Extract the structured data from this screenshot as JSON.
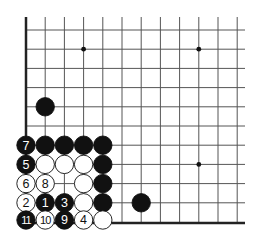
{
  "diagram": {
    "type": "go-board-corner",
    "grid": {
      "x0": 26,
      "y0": 30,
      "spacing": 19.2,
      "cols": 12,
      "rows": 11,
      "line_top": 17,
      "line_right": 245,
      "left_edge": true,
      "bottom_edge": true
    },
    "colors": {
      "line": "#555555",
      "edge": "#222222",
      "black": "#111111",
      "white": "#ffffff"
    },
    "star_points": [
      [
        3,
        1
      ],
      [
        9,
        1
      ],
      [
        9,
        7
      ]
    ],
    "stones": [
      {
        "col": 0,
        "row": 6,
        "color": "black",
        "label": "7"
      },
      {
        "col": 1,
        "row": 6,
        "color": "black",
        "label": ""
      },
      {
        "col": 2,
        "row": 6,
        "color": "black",
        "label": ""
      },
      {
        "col": 3,
        "row": 6,
        "color": "black",
        "label": ""
      },
      {
        "col": 4,
        "row": 6,
        "color": "black",
        "label": ""
      },
      {
        "col": 0,
        "row": 7,
        "color": "black",
        "label": "5"
      },
      {
        "col": 1,
        "row": 7,
        "color": "white",
        "label": ""
      },
      {
        "col": 2,
        "row": 7,
        "color": "white",
        "label": ""
      },
      {
        "col": 3,
        "row": 7,
        "color": "white",
        "label": ""
      },
      {
        "col": 4,
        "row": 7,
        "color": "black",
        "label": ""
      },
      {
        "col": 0,
        "row": 8,
        "color": "white",
        "label": "6"
      },
      {
        "col": 1,
        "row": 8,
        "color": "white",
        "label": "8"
      },
      {
        "col": 3,
        "row": 8,
        "color": "white",
        "label": ""
      },
      {
        "col": 4,
        "row": 8,
        "color": "black",
        "label": ""
      },
      {
        "col": 0,
        "row": 9,
        "color": "white",
        "label": "2"
      },
      {
        "col": 1,
        "row": 9,
        "color": "black",
        "label": "1"
      },
      {
        "col": 2,
        "row": 9,
        "color": "black",
        "label": "3"
      },
      {
        "col": 3,
        "row": 9,
        "color": "white",
        "label": ""
      },
      {
        "col": 4,
        "row": 9,
        "color": "black",
        "label": ""
      },
      {
        "col": 0,
        "row": 10,
        "color": "black",
        "label": "11"
      },
      {
        "col": 1,
        "row": 10,
        "color": "white",
        "label": "10"
      },
      {
        "col": 2,
        "row": 10,
        "color": "black",
        "label": "9"
      },
      {
        "col": 3,
        "row": 10,
        "color": "white",
        "label": "4"
      },
      {
        "col": 4,
        "row": 10,
        "color": "white",
        "label": ""
      },
      {
        "col": 1,
        "row": 4,
        "color": "black",
        "label": ""
      },
      {
        "col": 6,
        "row": 9,
        "color": "black",
        "label": ""
      }
    ]
  }
}
